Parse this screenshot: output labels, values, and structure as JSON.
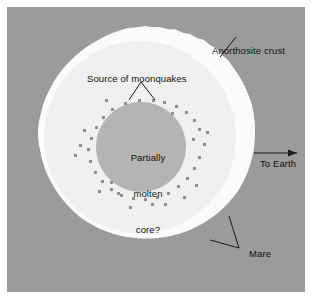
{
  "figure": {
    "background_color": "#ffffff",
    "panel_color": "#9b9b9b"
  },
  "colors": {
    "background": "#ffffff",
    "panel_gray": "#9b9b9b",
    "crust_white": "#fbfbfb",
    "mantle_offwhite": "#f0f0f0",
    "core_gray": "#b4b4b4",
    "quake_dot": "#8f8f8f",
    "label_text": "#111111",
    "leader_line": "#1a1a1a"
  },
  "labels": {
    "crust": "Anorthosite crust",
    "moonquakes": "Source of moonquakes",
    "core_line1": "Partially",
    "core_line2": "molten",
    "core_line3": "core?",
    "to_earth": "To Earth",
    "mare": "Mare"
  },
  "diagram_data": {
    "type": "cross-section",
    "moon": {
      "center_x": 133,
      "center_y": 129,
      "outer_radius": 109,
      "crust_thickness": 13
    },
    "core": {
      "center_x": 134,
      "center_y": 140,
      "radius": 45
    },
    "quake_dots_count": 42,
    "annotations": [
      {
        "name": "crust",
        "text": "Anorthosite crust",
        "leader": "diagonal"
      },
      {
        "name": "moonquakes",
        "text": "Source of moonquakes",
        "leader": "v-split"
      },
      {
        "name": "core",
        "text": "Partially molten core?",
        "leader": "none"
      },
      {
        "name": "to_earth",
        "text": "To Earth",
        "leader": "arrow-right"
      },
      {
        "name": "mare",
        "text": "Mare",
        "leader": "v-split"
      }
    ]
  }
}
